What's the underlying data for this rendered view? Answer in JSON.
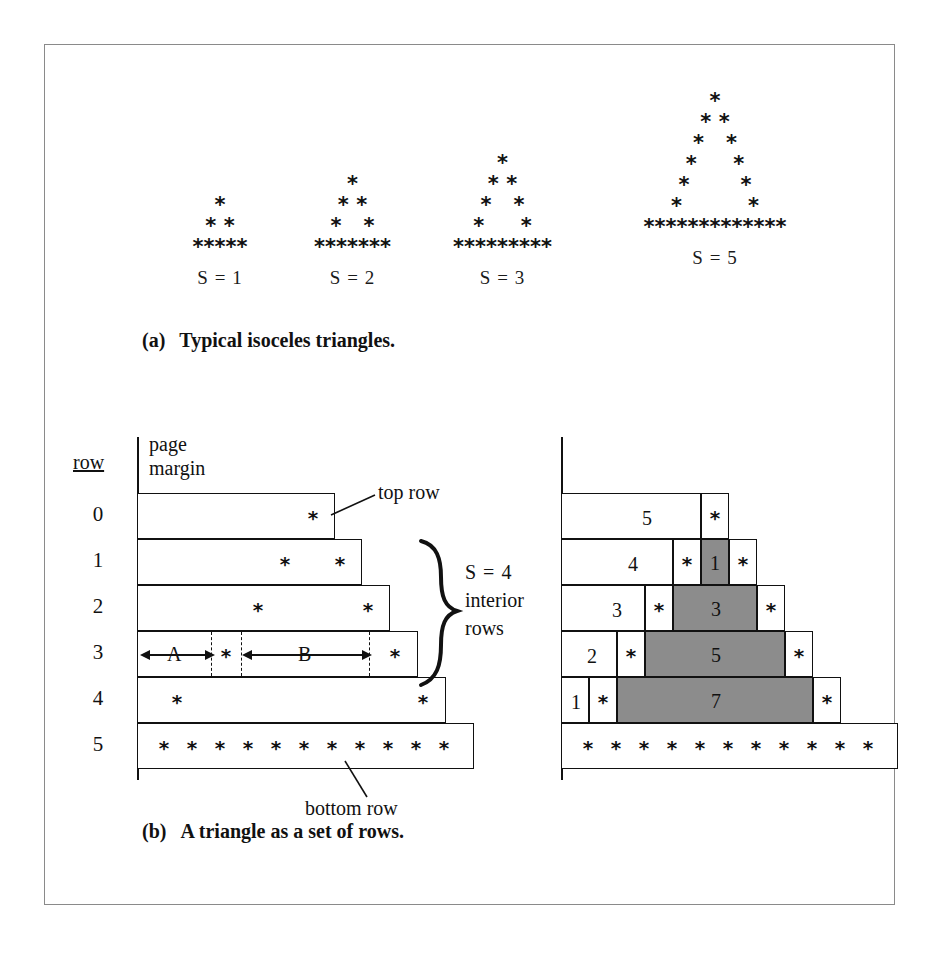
{
  "figure": {
    "parts": [
      {
        "tag": "(a)",
        "caption": "Typical isoceles triangles."
      },
      {
        "tag": "(b)",
        "caption": "A triangle as a set of rows."
      }
    ]
  },
  "part_a": {
    "star_char": "*",
    "triangles": [
      {
        "label": "S = 1",
        "rows": [
          "*",
          "* *",
          "*****"
        ],
        "base_count": 5
      },
      {
        "label": "S = 2",
        "rows": [
          "*",
          "* *",
          "*   *",
          "*******"
        ],
        "base_count": 7
      },
      {
        "label": "S = 3",
        "rows": [
          "*",
          "* *",
          "*   *",
          "*     *",
          "*********"
        ],
        "base_count": 9
      },
      {
        "label": "S = 5",
        "rows": [
          "*",
          "* *",
          "*   *",
          "*     *",
          "*       *",
          "*         *",
          "*************"
        ],
        "base_count": 13
      }
    ]
  },
  "part_b": {
    "row_header": "row",
    "page_margin_label_line1": "page",
    "page_margin_label_line2": "margin",
    "row_numbers": [
      "0",
      "1",
      "2",
      "3",
      "4",
      "5"
    ],
    "annotations": {
      "top_row": "top row",
      "bottom_row": "bottom row",
      "brace_line1": "S = 4",
      "brace_line2": "interior",
      "brace_line3": "rows",
      "segment_a": "A",
      "segment_b": "B"
    },
    "left_diagram": {
      "rows": [
        {
          "row": "0",
          "stars": 1
        },
        {
          "row": "1",
          "stars": 2
        },
        {
          "row": "2",
          "stars": 2
        },
        {
          "row": "3",
          "stars": 2
        },
        {
          "row": "4",
          "stars": 2
        },
        {
          "row": "5",
          "stars": 11
        }
      ]
    },
    "right_diagram": {
      "rows": [
        {
          "row": "0",
          "left_count": "5",
          "inner": "",
          "stars": 1
        },
        {
          "row": "1",
          "left_count": "4",
          "inner": "1",
          "stars": 2
        },
        {
          "row": "2",
          "left_count": "3",
          "inner": "3",
          "stars": 2
        },
        {
          "row": "3",
          "left_count": "2",
          "inner": "5",
          "stars": 2
        },
        {
          "row": "4",
          "left_count": "1",
          "inner": "7",
          "stars": 2
        },
        {
          "row": "5",
          "left_count": "",
          "inner": "",
          "stars": 11
        }
      ],
      "shade_color": "#8c8c8c"
    }
  }
}
